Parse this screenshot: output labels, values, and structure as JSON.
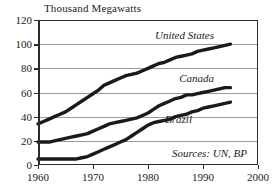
{
  "chart_data": {
    "type": "line",
    "title": "Thousand Megawatts",
    "xlabel": "",
    "ylabel": "Thousand Megawatts",
    "xlim": [
      1960,
      2000
    ],
    "ylim": [
      0,
      120
    ],
    "xticks": [
      1960,
      1970,
      1980,
      1990,
      2000
    ],
    "yticks": [
      0,
      20,
      40,
      60,
      80,
      100,
      120
    ],
    "grid": true,
    "legend_position": "inline-annotations",
    "annotations": [
      {
        "text": "United States",
        "x": 1992,
        "y": 108
      },
      {
        "text": "Canada",
        "x": 1992,
        "y": 72
      },
      {
        "text": "Brazil",
        "x": 1988,
        "y": 38
      },
      {
        "text": "Sources: UN, BP",
        "x": 1998,
        "y": 10
      }
    ],
    "x": [
      1960,
      1961,
      1962,
      1963,
      1964,
      1965,
      1966,
      1967,
      1968,
      1969,
      1970,
      1971,
      1972,
      1973,
      1974,
      1975,
      1976,
      1977,
      1978,
      1979,
      1980,
      1981,
      1982,
      1983,
      1984,
      1985,
      1986,
      1987,
      1988,
      1989,
      1990,
      1991,
      1992,
      1993,
      1994,
      1995
    ],
    "series": [
      {
        "name": "United States",
        "values": [
          34,
          36,
          38,
          40,
          42,
          44,
          47,
          50,
          53,
          56,
          59,
          62,
          66,
          68,
          70,
          72,
          74,
          75,
          76,
          78,
          80,
          82,
          84,
          85,
          87,
          89,
          90,
          91,
          92,
          94,
          95,
          96,
          97,
          98,
          99,
          100
        ]
      },
      {
        "name": "Canada",
        "values": [
          19,
          19,
          19,
          20,
          21,
          22,
          23,
          24,
          25,
          26,
          28,
          30,
          32,
          34,
          35,
          36,
          37,
          38,
          39,
          41,
          43,
          46,
          49,
          51,
          53,
          55,
          56,
          58,
          58,
          59,
          60,
          61,
          62,
          63,
          64,
          64
        ]
      },
      {
        "name": "Brazil",
        "values": [
          5,
          5,
          5,
          5,
          5,
          5,
          5,
          5,
          6,
          7,
          9,
          11,
          13,
          15,
          17,
          19,
          21,
          24,
          27,
          30,
          33,
          35,
          36,
          37,
          38,
          40,
          41,
          42,
          44,
          45,
          47,
          48,
          49,
          50,
          51,
          52
        ]
      }
    ]
  }
}
